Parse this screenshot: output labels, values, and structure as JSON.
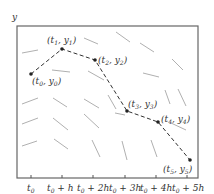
{
  "figure": {
    "y_axis_label": "y",
    "x_ticks": [
      "t0",
      "t0 + h",
      "t0 + 2h",
      "t0 + 3h",
      "t0 + 4h",
      "t0 + 5h"
    ],
    "x_tick_labels": [
      {
        "base": "t",
        "sub": "0",
        "rest": ""
      },
      {
        "base": "t",
        "sub": "0",
        "rest": " + h"
      },
      {
        "base": "t",
        "sub": "0",
        "rest": " + 2h"
      },
      {
        "base": "t",
        "sub": "0",
        "rest": " + 3h"
      },
      {
        "base": "t",
        "sub": "0",
        "rest": " + 4h"
      },
      {
        "base": "t",
        "sub": "0",
        "rest": " + 5h"
      }
    ],
    "points": [
      {
        "label": "(t0, y0)",
        "t": "t",
        "ti": "0",
        "y": "y",
        "yi": "0"
      },
      {
        "label": "(t1, y1)",
        "t": "t",
        "ti": "1",
        "y": "y",
        "yi": "1"
      },
      {
        "label": "(t2, y2)",
        "t": "t",
        "ti": "2",
        "y": "y",
        "yi": "2"
      },
      {
        "label": "(t3, y3)",
        "t": "t",
        "ti": "3",
        "y": "y",
        "yi": "3"
      },
      {
        "label": "(t4, y4)",
        "t": "t",
        "ti": "4",
        "y": "y",
        "yi": "4"
      },
      {
        "label": "(t5, y5)",
        "t": "t",
        "ti": "5",
        "y": "y",
        "yi": "5"
      }
    ],
    "colors": {
      "frame": "#555555",
      "path": "#333333",
      "slopes": "#aaaaaa",
      "text": "#333333"
    }
  }
}
